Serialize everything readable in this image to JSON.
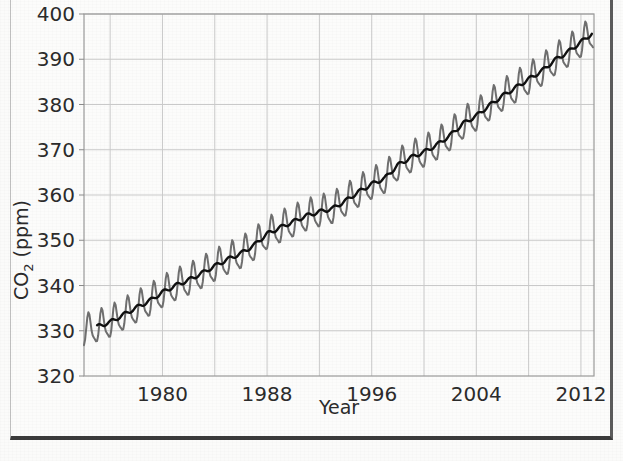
{
  "figure": {
    "name": "keeling-curve-figure",
    "background_color": "#fcfcfb",
    "frame_color": "#3b3b3b"
  },
  "chart_data": {
    "type": "line",
    "title": "",
    "xlabel": "Year",
    "ylabel": "CO2 (ppm)",
    "ylabel_base": "CO",
    "ylabel_sub": "2",
    "ylabel_unit": " (ppm)",
    "xlim": [
      1974,
      2013
    ],
    "ylim": [
      320,
      400
    ],
    "xticks": [
      1980,
      1988,
      1996,
      2004,
      2012
    ],
    "xticklabels": [
      "1980",
      "1988",
      "1996",
      "2004",
      "2012"
    ],
    "xgrid_minor": [
      1976,
      1980,
      1984,
      1988,
      1992,
      1996,
      2000,
      2004,
      2008,
      2012
    ],
    "yticks": [
      320,
      330,
      340,
      350,
      360,
      370,
      380,
      390,
      400
    ],
    "yticklabels": [
      "320",
      "330",
      "340",
      "350",
      "360",
      "370",
      "380",
      "390",
      "400"
    ],
    "grid": true,
    "grid_color": "#c9c9c9",
    "legend": "none",
    "series": [
      {
        "name": "Monthly mean CO2 (seasonal cycle)",
        "color": "#6e6e6e",
        "linewidth": 2.0,
        "type": "oscillating",
        "seasonal_amplitude_ppm": 3.3,
        "seasonal_peak_month": 5,
        "seasonal_trough_month": 10,
        "description": "Monthly atmospheric CO2 concentration measured at Mauna Loa, showing annual seasonal oscillation superimposed on rising trend"
      },
      {
        "name": "Smoothed trend",
        "color": "#101010",
        "linewidth": 2.4,
        "type": "trend",
        "description": "Seasonally adjusted / smoothed long term CO2 trend"
      }
    ],
    "trend_points": [
      {
        "x": 1974.0,
        "y": 330.0
      },
      {
        "x": 1975.0,
        "y": 330.9
      },
      {
        "x": 1976.0,
        "y": 331.9
      },
      {
        "x": 1977.0,
        "y": 333.5
      },
      {
        "x": 1978.0,
        "y": 335.1
      },
      {
        "x": 1979.0,
        "y": 336.6
      },
      {
        "x": 1980.0,
        "y": 338.5
      },
      {
        "x": 1981.0,
        "y": 340.0
      },
      {
        "x": 1982.0,
        "y": 341.2
      },
      {
        "x": 1983.0,
        "y": 342.7
      },
      {
        "x": 1984.0,
        "y": 344.3
      },
      {
        "x": 1985.0,
        "y": 345.8
      },
      {
        "x": 1986.0,
        "y": 347.1
      },
      {
        "x": 1987.0,
        "y": 348.9
      },
      {
        "x": 1988.0,
        "y": 351.4
      },
      {
        "x": 1989.0,
        "y": 352.8
      },
      {
        "x": 1990.0,
        "y": 354.1
      },
      {
        "x": 1991.0,
        "y": 355.4
      },
      {
        "x": 1992.0,
        "y": 356.3
      },
      {
        "x": 1993.0,
        "y": 357.0
      },
      {
        "x": 1994.0,
        "y": 358.7
      },
      {
        "x": 1995.0,
        "y": 360.7
      },
      {
        "x": 1996.0,
        "y": 362.4
      },
      {
        "x": 1997.0,
        "y": 363.7
      },
      {
        "x": 1998.0,
        "y": 366.6
      },
      {
        "x": 1999.0,
        "y": 368.3
      },
      {
        "x": 2000.0,
        "y": 369.5
      },
      {
        "x": 2001.0,
        "y": 371.1
      },
      {
        "x": 2002.0,
        "y": 373.2
      },
      {
        "x": 2003.0,
        "y": 375.8
      },
      {
        "x": 2004.0,
        "y": 377.5
      },
      {
        "x": 2005.0,
        "y": 379.8
      },
      {
        "x": 2006.0,
        "y": 381.9
      },
      {
        "x": 2007.0,
        "y": 383.7
      },
      {
        "x": 2008.0,
        "y": 385.6
      },
      {
        "x": 2009.0,
        "y": 387.4
      },
      {
        "x": 2010.0,
        "y": 389.8
      },
      {
        "x": 2011.0,
        "y": 391.6
      },
      {
        "x": 2012.0,
        "y": 393.8
      },
      {
        "x": 2012.9,
        "y": 395.8
      }
    ],
    "notable_values": {
      "start_ppm": 322.5,
      "end_peak_ppm": 399.0,
      "end_trend_ppm": 396.0
    }
  },
  "plot_geometry": {
    "left_px": 84,
    "right_px": 594,
    "top_px": 14,
    "bottom_px": 376
  }
}
